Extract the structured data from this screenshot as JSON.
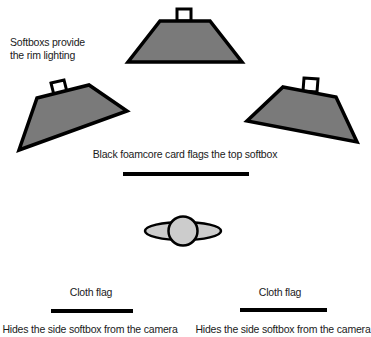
{
  "diagram": {
    "type": "lighting-setup",
    "colors": {
      "softbox_fill": "#7a7a7a",
      "outline": "#000000",
      "subject_fill": "#cccccc",
      "flag": "#000000",
      "background": "#ffffff"
    },
    "labels": {
      "softboxes_line1": "Softboxs provide",
      "softboxes_line2": "the rim lighting",
      "top_flag": "Black foamcore card flags the top softbox",
      "left_flag_title": "Cloth flag",
      "left_flag_caption": "Hides the side softbox from the camera",
      "right_flag_title": "Cloth flag",
      "right_flag_caption": "Hides the side softbox from the camera"
    },
    "elements": [
      {
        "id": "softbox-top",
        "kind": "softbox"
      },
      {
        "id": "softbox-left",
        "kind": "softbox"
      },
      {
        "id": "softbox-right",
        "kind": "softbox"
      },
      {
        "id": "foamcore-flag",
        "kind": "flag"
      },
      {
        "id": "subject",
        "kind": "person-top-view"
      },
      {
        "id": "cloth-flag-left",
        "kind": "flag"
      },
      {
        "id": "cloth-flag-right",
        "kind": "flag"
      }
    ]
  }
}
